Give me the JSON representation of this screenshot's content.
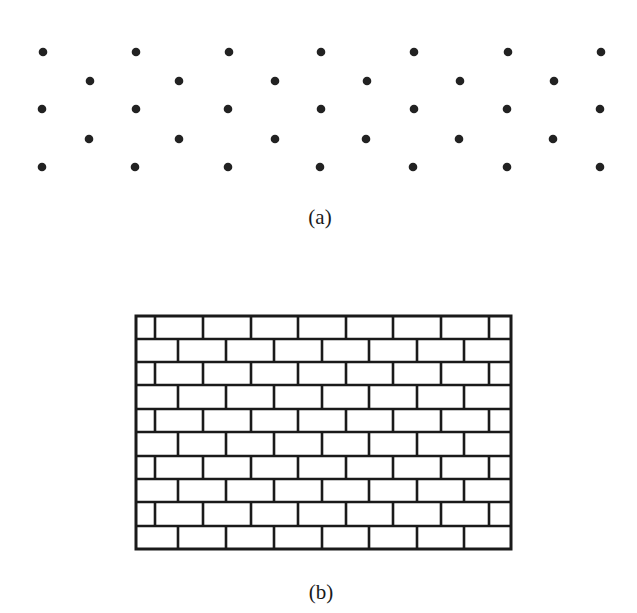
{
  "figure": {
    "panel_a": {
      "caption": "(a)",
      "description": "triangular (hexagonal) lattice of points",
      "dot_color": "#222222",
      "rows": [
        {
          "y": 52,
          "xs": [
            43,
            136,
            229,
            321,
            414,
            508,
            601
          ]
        },
        {
          "y": 81,
          "xs": [
            90,
            179,
            275,
            367,
            460,
            554
          ]
        },
        {
          "y": 109,
          "xs": [
            42,
            136,
            228,
            321,
            414,
            507,
            600
          ]
        },
        {
          "y": 139,
          "xs": [
            89,
            179,
            275,
            366,
            459,
            553
          ]
        },
        {
          "y": 167,
          "xs": [
            42,
            135,
            228,
            320,
            413,
            507,
            600
          ]
        }
      ]
    },
    "panel_b": {
      "caption": "(b)",
      "description": "brick wall pattern (running bond)",
      "line_color": "#1a1a1a",
      "frame": {
        "left": 136,
        "top": 316,
        "right": 511,
        "bottom": 549
      },
      "row_count": 10,
      "row_lines_y": [
        316,
        339,
        362,
        385,
        409,
        432,
        456,
        479,
        502,
        526,
        549
      ],
      "odd_row_joints_x": [
        155,
        203,
        251,
        298,
        346,
        393,
        441,
        489
      ],
      "even_row_joints_x": [
        178,
        226,
        274,
        322,
        369,
        417,
        464
      ]
    }
  }
}
